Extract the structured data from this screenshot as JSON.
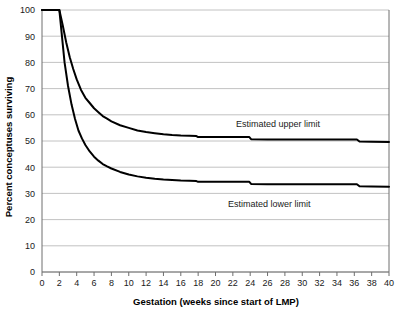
{
  "chart_data": {
    "type": "line",
    "title": "",
    "xlabel": "Gestation (weeks since start of LMP)",
    "ylabel": "Percent conceptuses surviving",
    "xlim": [
      0,
      40
    ],
    "ylim": [
      0,
      100
    ],
    "xticks": [
      0,
      2,
      4,
      6,
      8,
      10,
      12,
      14,
      16,
      18,
      20,
      22,
      24,
      26,
      28,
      30,
      32,
      34,
      36,
      38,
      40
    ],
    "yticks": [
      0,
      10,
      20,
      30,
      40,
      50,
      60,
      70,
      80,
      90,
      100
    ],
    "grid": "horizontal",
    "legend_position": "inline-annotations",
    "line_color": "#000000",
    "grid_color": "#b3b3b3",
    "axis_color": "#808080",
    "series": [
      {
        "name": "Estimated upper limit",
        "x": [
          0,
          1,
          2,
          2.4,
          2.8,
          3.2,
          3.6,
          4,
          4.5,
          5,
          5.5,
          6,
          6.5,
          7,
          7.5,
          8,
          9,
          10,
          11,
          12,
          13,
          14,
          15,
          16,
          17,
          17.8,
          18,
          20,
          22,
          23.9,
          24.1,
          26,
          30,
          34,
          36.3,
          36.6,
          38,
          40
        ],
        "y": [
          100,
          100,
          100,
          94,
          87.5,
          82,
          77.5,
          73.5,
          69.5,
          66.5,
          64.5,
          62.5,
          61,
          59.5,
          58.5,
          57.5,
          56,
          55,
          54,
          53.4,
          53,
          52.6,
          52.3,
          52.1,
          52,
          51.9,
          51.5,
          51.5,
          51.5,
          51.5,
          50.7,
          50.6,
          50.6,
          50.6,
          50.6,
          49.8,
          49.7,
          49.6
        ]
      },
      {
        "name": "Estimated lower limit",
        "x": [
          0,
          1,
          2,
          2.3,
          2.6,
          3,
          3.4,
          3.8,
          4.2,
          4.6,
          5,
          5.5,
          6,
          6.5,
          7,
          7.5,
          8,
          9,
          10,
          11,
          12,
          13,
          14,
          15,
          16,
          17,
          17.8,
          18,
          20,
          22,
          23.9,
          24.1,
          26,
          30,
          34,
          36.3,
          36.6,
          38,
          40
        ],
        "y": [
          100,
          100,
          100,
          90,
          80,
          71,
          64,
          58.5,
          54,
          51,
          48.5,
          46,
          44,
          42.5,
          41.2,
          40.3,
          39.5,
          38.2,
          37.2,
          36.5,
          36,
          35.6,
          35.3,
          35.1,
          34.9,
          34.8,
          34.7,
          34.4,
          34.4,
          34.4,
          34.4,
          33.6,
          33.5,
          33.5,
          33.5,
          33.5,
          32.7,
          32.6,
          32.5
        ]
      }
    ],
    "annotations": [
      {
        "text": "Estimated upper limit",
        "x": 27.2,
        "y": 55.5
      },
      {
        "text": "Estimated lower limit",
        "x": 26.2,
        "y": 25.0
      }
    ]
  }
}
